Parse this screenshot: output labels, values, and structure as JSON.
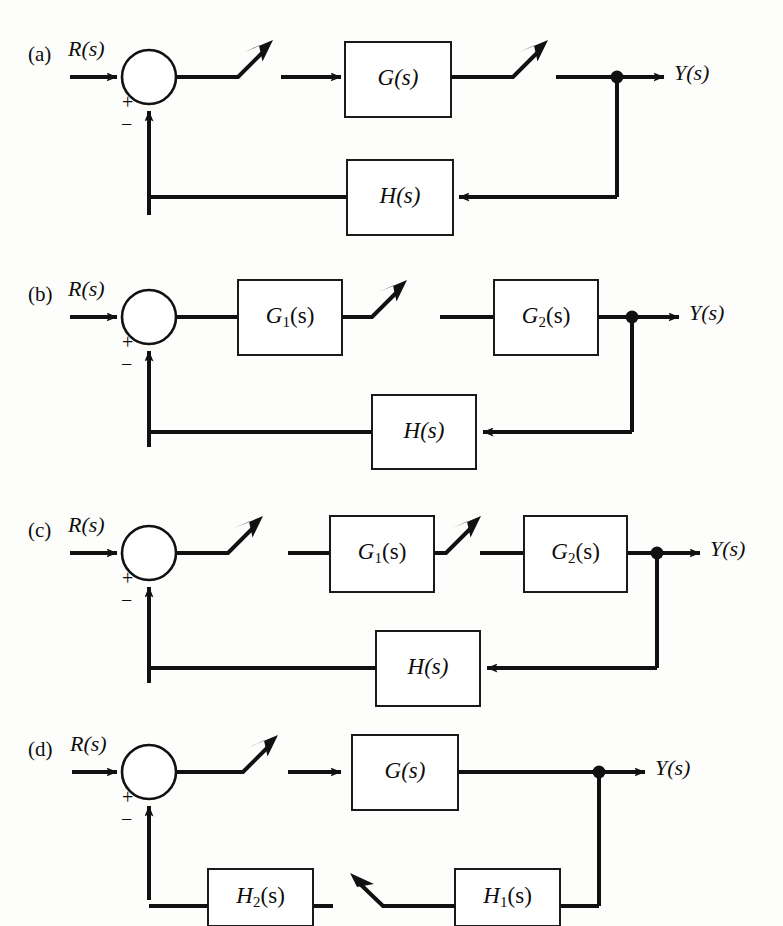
{
  "figure": {
    "type": "control-system-block-diagrams",
    "panel_count": 4,
    "line_color": "#111111",
    "background": "#fdfdfc"
  },
  "panels": [
    {
      "tag": "(a)",
      "input_label": "R(s)",
      "output_label": "Y(s)",
      "plus_sign": "+",
      "minus_sign": "−",
      "forward_blocks": [
        "G(s)"
      ],
      "feedback_blocks": [
        "H(s)"
      ],
      "break_arrows": 2,
      "break_arrow_direction": "up-right",
      "description": "Single forward block G(s) with unity-path feedback through H(s); two broken forward-path links."
    },
    {
      "tag": "(b)",
      "input_label": "R(s)",
      "output_label": "Y(s)",
      "plus_sign": "+",
      "minus_sign": "−",
      "forward_blocks": [
        "G1(s)",
        "G2(s)"
      ],
      "feedback_blocks": [
        "H(s)"
      ],
      "break_arrows": 1,
      "break_arrow_direction": "up-right",
      "description": "Cascade of G1(s) and G2(s) with feedback through H(s); one broken link between G1 and G2."
    },
    {
      "tag": "(c)",
      "input_label": "R(s)",
      "output_label": "Y(s)",
      "plus_sign": "+",
      "minus_sign": "−",
      "forward_blocks": [
        "G1(s)",
        "G2(s)"
      ],
      "feedback_blocks": [
        "H(s)"
      ],
      "break_arrows": 2,
      "break_arrow_direction": "up-right",
      "description": "Cascade of G1(s) and G2(s) with feedback through H(s); broken links before G1 and between G1 and G2."
    },
    {
      "tag": "(d)",
      "input_label": "R(s)",
      "output_label": "Y(s)",
      "plus_sign": "+",
      "minus_sign": "−",
      "forward_blocks": [
        "G(s)"
      ],
      "feedback_blocks": [
        "H1(s)",
        "H2(s)"
      ],
      "break_arrows": 2,
      "break_arrow_direction": "mixed",
      "description": "Forward block G(s) with feedback through H1(s) then H2(s); broken link in forward path and in feedback path between H1 and H2."
    }
  ],
  "labels": {
    "panel_a_tag": "(a)",
    "panel_b_tag": "(b)",
    "panel_c_tag": "(c)",
    "panel_d_tag": "(d)",
    "r_of_s": "R(s)",
    "y_of_s": "Y(s)",
    "plus": "+",
    "minus": "−",
    "g_of_s": "G(s)",
    "h_of_s": "H(s)",
    "g_one_base": "G",
    "g_one_sub": "1",
    "g_one_tail": "(s)",
    "g_two_base": "G",
    "g_two_sub": "2",
    "g_two_tail": "(s)",
    "h_one_base": "H",
    "h_one_sub": "1",
    "h_one_tail": "(s)",
    "h_two_base": "H",
    "h_two_sub": "2",
    "h_two_tail": "(s)"
  }
}
